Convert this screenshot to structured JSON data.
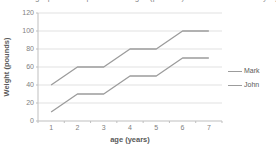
{
  "cropped_top_text": "Use the graph to compare the weight (pounds) of Mark and John by age (years)",
  "chart_data": {
    "type": "line",
    "title": "",
    "xlabel": "age (years)",
    "ylabel": "Weight (pounds)",
    "x": [
      1,
      2,
      3,
      4,
      5,
      6,
      7
    ],
    "series": [
      {
        "name": "Mark",
        "values": [
          40,
          60,
          60,
          80,
          80,
          100,
          100
        ]
      },
      {
        "name": "John",
        "values": [
          10,
          30,
          30,
          50,
          50,
          70,
          70
        ]
      }
    ],
    "ylim": [
      0,
      120
    ],
    "ytick_step": 20,
    "grid": true,
    "legend_position": "right"
  },
  "colors": {
    "background": "#ffffff",
    "series_line": "#9c9c9c",
    "gridline": "#e1e1e1",
    "axis_line": "#bfbfbf",
    "tick_text": "#808080",
    "axis_title_text": "#595959"
  }
}
